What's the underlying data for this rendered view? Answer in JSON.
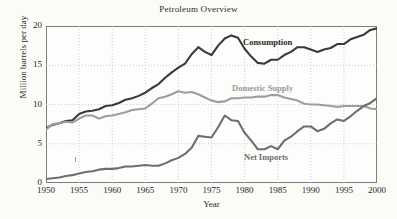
{
  "chart_data": {
    "type": "line",
    "title": "Petroleum Overview",
    "xlabel": "Year",
    "ylabel": "Million barrels per day",
    "xlim": [
      1950,
      2000
    ],
    "ylim": [
      0,
      20
    ],
    "xticks": [
      "1950",
      "1955",
      "1960",
      "1965",
      "1970",
      "1975",
      "1980",
      "1985",
      "1990",
      "1995",
      "2000"
    ],
    "yticks": [
      "0",
      "5",
      "10",
      "15",
      "20"
    ],
    "grid": true,
    "legend_position": "inline-annotations",
    "x": [
      1950,
      1951,
      1952,
      1953,
      1954,
      1955,
      1956,
      1957,
      1958,
      1959,
      1960,
      1961,
      1962,
      1963,
      1964,
      1965,
      1966,
      1967,
      1968,
      1969,
      1970,
      1971,
      1972,
      1973,
      1974,
      1975,
      1976,
      1977,
      1978,
      1979,
      1980,
      1981,
      1982,
      1983,
      1984,
      1985,
      1986,
      1987,
      1988,
      1989,
      1990,
      1991,
      1992,
      1993,
      1994,
      1995,
      1996,
      1997,
      1998,
      1999,
      2000
    ],
    "series": [
      {
        "name": "Consumption",
        "color": "#3a3a3a",
        "values": [
          7.0,
          7.4,
          7.6,
          7.9,
          8.0,
          8.8,
          9.1,
          9.2,
          9.4,
          9.8,
          9.9,
          10.2,
          10.6,
          10.8,
          11.1,
          11.5,
          12.1,
          12.6,
          13.4,
          14.1,
          14.7,
          15.2,
          16.4,
          17.3,
          16.7,
          16.3,
          17.5,
          18.4,
          18.8,
          18.5,
          17.1,
          16.1,
          15.3,
          15.2,
          15.7,
          15.7,
          16.3,
          16.7,
          17.3,
          17.3,
          17.0,
          16.7,
          17.0,
          17.2,
          17.7,
          17.7,
          18.3,
          18.6,
          18.9,
          19.5,
          19.7
        ]
      },
      {
        "name": "Domestic Supply",
        "color": "#9d9d9d",
        "values": [
          6.8,
          7.5,
          7.6,
          7.8,
          7.7,
          8.2,
          8.6,
          8.6,
          8.2,
          8.5,
          8.6,
          8.8,
          9.0,
          9.3,
          9.4,
          9.5,
          10.1,
          10.8,
          11.0,
          11.3,
          11.7,
          11.5,
          11.6,
          11.3,
          10.9,
          10.5,
          10.3,
          10.4,
          10.8,
          10.8,
          10.9,
          10.9,
          11.0,
          11.0,
          11.2,
          11.2,
          10.9,
          10.7,
          10.5,
          10.1,
          10.0,
          10.0,
          9.9,
          9.8,
          9.7,
          9.8,
          9.8,
          9.8,
          9.8,
          9.5,
          9.4
        ]
      },
      {
        "name": "Net Imports",
        "color": "#6e6e6e",
        "values": [
          0.5,
          0.6,
          0.7,
          0.9,
          1.0,
          1.2,
          1.4,
          1.5,
          1.7,
          1.8,
          1.8,
          1.9,
          2.1,
          2.1,
          2.2,
          2.3,
          2.2,
          2.2,
          2.5,
          2.9,
          3.2,
          3.7,
          4.5,
          6.0,
          5.9,
          5.8,
          7.1,
          8.6,
          8.0,
          7.9,
          6.4,
          5.4,
          4.3,
          4.3,
          4.7,
          4.3,
          5.4,
          5.9,
          6.6,
          7.2,
          7.2,
          6.6,
          6.9,
          7.6,
          8.1,
          7.9,
          8.5,
          9.2,
          9.8,
          10.2,
          10.8
        ]
      }
    ]
  }
}
